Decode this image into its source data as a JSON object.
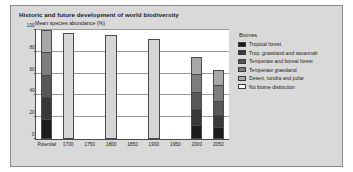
{
  "chart_data": {
    "type": "bar",
    "title": "Historic and future development of world biodiversity",
    "xlabel": "",
    "ylabel": "Mean species abundance (%)",
    "ylim": [
      0,
      100
    ],
    "yticks": [
      0,
      20,
      40,
      60,
      80,
      100
    ],
    "ytick_labels": [
      "0",
      "20",
      "40",
      "60",
      "80",
      "100"
    ],
    "grid": true,
    "stacked": true,
    "legend_position": "right",
    "categories": [
      "Potential",
      "1700",
      "1750",
      "1800",
      "1850",
      "1900",
      "1950",
      "2000",
      "2050"
    ],
    "series": [
      {
        "name": "Tropical forest",
        "color": "#1c1c1c",
        "values": [
          17,
          0,
          0,
          0,
          0,
          0,
          0,
          11,
          9
        ]
      },
      {
        "name": "Trop. grassland and savannah",
        "color": "#383838",
        "values": [
          20,
          0,
          0,
          0,
          0,
          0,
          0,
          15,
          12
        ]
      },
      {
        "name": "Temperate and boreal forest",
        "color": "#585858",
        "values": [
          21,
          0,
          0,
          0,
          0,
          0,
          0,
          16,
          13
        ]
      },
      {
        "name": "Temperate grassland",
        "color": "#7d7d7d",
        "values": [
          21,
          0,
          0,
          0,
          0,
          0,
          0,
          17,
          15
        ]
      },
      {
        "name": "Desert, tundra and polar",
        "color": "#a8a8a8",
        "values": [
          21,
          0,
          0,
          0,
          0,
          0,
          0,
          16,
          14
        ]
      },
      {
        "name": "No biome distinction",
        "color": "#d6d6d6",
        "values": [
          0,
          97,
          0,
          95,
          0,
          92,
          0,
          0,
          0
        ]
      }
    ],
    "totals": [
      100,
      97,
      0,
      95,
      0,
      92,
      0,
      75,
      63
    ]
  },
  "legend": {
    "title": "Biomes",
    "entries": [
      {
        "label": "Tropical forest",
        "color": "#1c1c1c"
      },
      {
        "label": "Trop. grassland and savannah",
        "color": "#383838"
      },
      {
        "label": "Temperate and boreal forest",
        "color": "#585858"
      },
      {
        "label": "Temperate grassland",
        "color": "#7d7d7d"
      },
      {
        "label": "Desert, tundra and polar",
        "color": "#a8a8a8"
      },
      {
        "label": "No biome distinction",
        "color": "#ffffff"
      }
    ]
  },
  "style": {
    "figure_background": "#d9d9d9",
    "plot_background": "#ffffff",
    "axis_color": "#4a4a4a",
    "grid_color": "#9a9a9a",
    "text_color": "#1a1a1a"
  }
}
